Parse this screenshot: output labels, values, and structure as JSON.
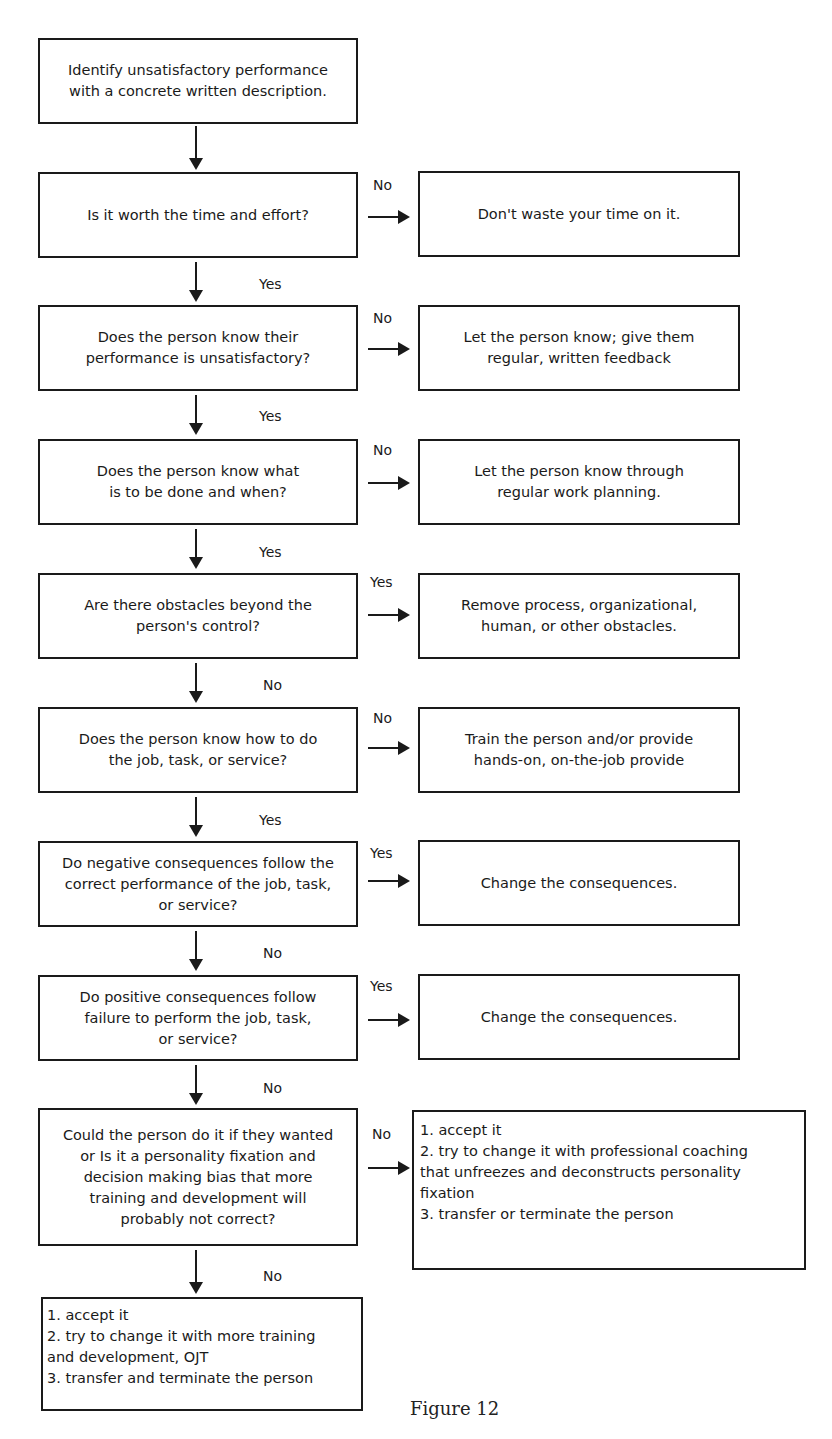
{
  "figure": {
    "caption": "Figure 12",
    "start": {
      "lines": [
        "Identify unsatisfactory performance",
        "with a concrete written description."
      ]
    },
    "steps": [
      {
        "question": [
          "Is it worth the time and effort?"
        ],
        "branch_label": "No",
        "action": [
          "Don't waste your time on it."
        ],
        "continue_label": "Yes"
      },
      {
        "question": [
          "Does the person know their",
          "performance is unsatisfactory?"
        ],
        "branch_label": "No",
        "action": [
          "Let the person know; give them",
          "regular, written feedback"
        ],
        "continue_label": "Yes"
      },
      {
        "question": [
          "Does the person know what",
          "is to be done and when?"
        ],
        "branch_label": "No",
        "action": [
          "Let the person know through",
          "regular work planning."
        ],
        "continue_label": "Yes"
      },
      {
        "question": [
          "Are there obstacles beyond the",
          "person's control?"
        ],
        "branch_label": "Yes",
        "action": [
          "Remove process, organizational,",
          "human, or other obstacles."
        ],
        "continue_label": "No"
      },
      {
        "question": [
          "Does the person know how to do",
          "the job, task, or service?"
        ],
        "branch_label": "No",
        "action": [
          "Train the person and/or provide",
          "hands-on, on-the-job provide"
        ],
        "continue_label": "Yes"
      },
      {
        "question": [
          "Do negative consequences follow the",
          "correct performance of the job, task,",
          "or service?"
        ],
        "branch_label": "Yes",
        "action": [
          "Change the consequences."
        ],
        "continue_label": "No"
      },
      {
        "question": [
          "Do positive consequences follow",
          "failure to perform the job, task,",
          "or service?"
        ],
        "branch_label": "Yes",
        "action": [
          "Change the consequences."
        ],
        "continue_label": "No"
      },
      {
        "question": [
          "Could the person do it if they wanted",
          "or Is it a personality fixation and",
          "decision making bias that more",
          "training and development will",
          "probably not correct?"
        ],
        "branch_label": "No",
        "action": [
          "1. accept it",
          "2. try to change it with professional coaching",
          "that unfreezes and deconstructs personality",
          "fixation",
          "3. transfer or terminate the person"
        ],
        "continue_label": "No"
      }
    ],
    "end": {
      "lines": [
        "1. accept it",
        "2. try to change it with more training",
        "and development, OJT",
        "3. transfer and terminate the person"
      ]
    }
  }
}
